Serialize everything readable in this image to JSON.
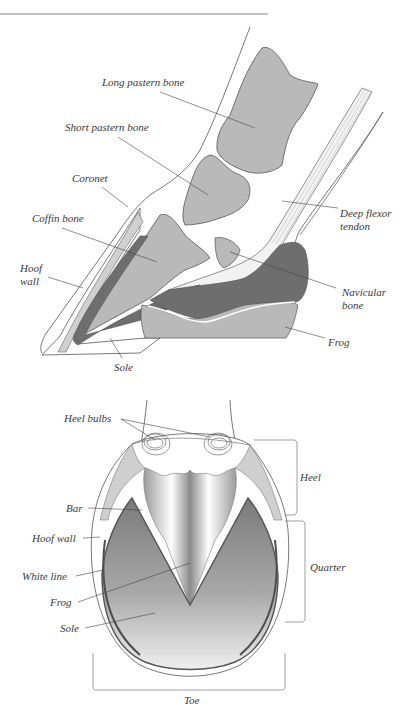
{
  "figure": {
    "side_view": {
      "title": "Lateral cross-section of the horse hoof",
      "labels": {
        "long_pastern": "Long pastern bone",
        "short_pastern": "Short pastern bone",
        "coronet": "Coronet",
        "coffin_bone": "Coffin bone",
        "hoof_wall_1": "Hoof",
        "hoof_wall_2": "wall",
        "sole": "Sole",
        "deep_flexor_1": "Deep flexor",
        "deep_flexor_2": "tendon",
        "navicular_1": "Navicular",
        "navicular_2": "bone",
        "frog": "Frog"
      }
    },
    "bottom_view": {
      "title": "Ground surface of the horse hoof",
      "labels": {
        "heel_bulbs": "Heel bulbs",
        "bar": "Bar",
        "hoof_wall": "Hoof wall",
        "white_line": "White line",
        "frog": "Frog",
        "sole": "Sole"
      },
      "regions": {
        "heel": "Heel",
        "quarter": "Quarter",
        "toe": "Toe"
      }
    },
    "colors": {
      "bone": "#b9b9b9",
      "dark_tissue": "#6e6e6e",
      "outline": "#555555",
      "leader": "#444444"
    }
  }
}
